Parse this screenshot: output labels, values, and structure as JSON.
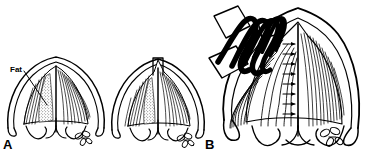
{
  "figure": {
    "background_color": "#ffffff",
    "ink_color": "#000000",
    "width": 366,
    "height": 158
  },
  "panels": [
    {
      "id": "panel-a",
      "letter": "A",
      "description": "Two pre-operative cross-sections of the chevron-shaped structure with hatched muscle striations, stippled fat pad and scalloped base.",
      "labels": [
        {
          "id": "fat-callout",
          "text": "Fat",
          "leader_line": true
        }
      ]
    },
    {
      "id": "panel-b",
      "letter": "B",
      "description": "Enlarged cross-section with surgical instrument (coiled black shaft and two blade plates) applied at upper left and a vertical column of rightward arrows indicating direction of force.",
      "labels": []
    }
  ],
  "annotations": {
    "arrow_count": 8,
    "arrow_direction": "right",
    "instrument_blades": 3,
    "coil_loops": 5
  }
}
